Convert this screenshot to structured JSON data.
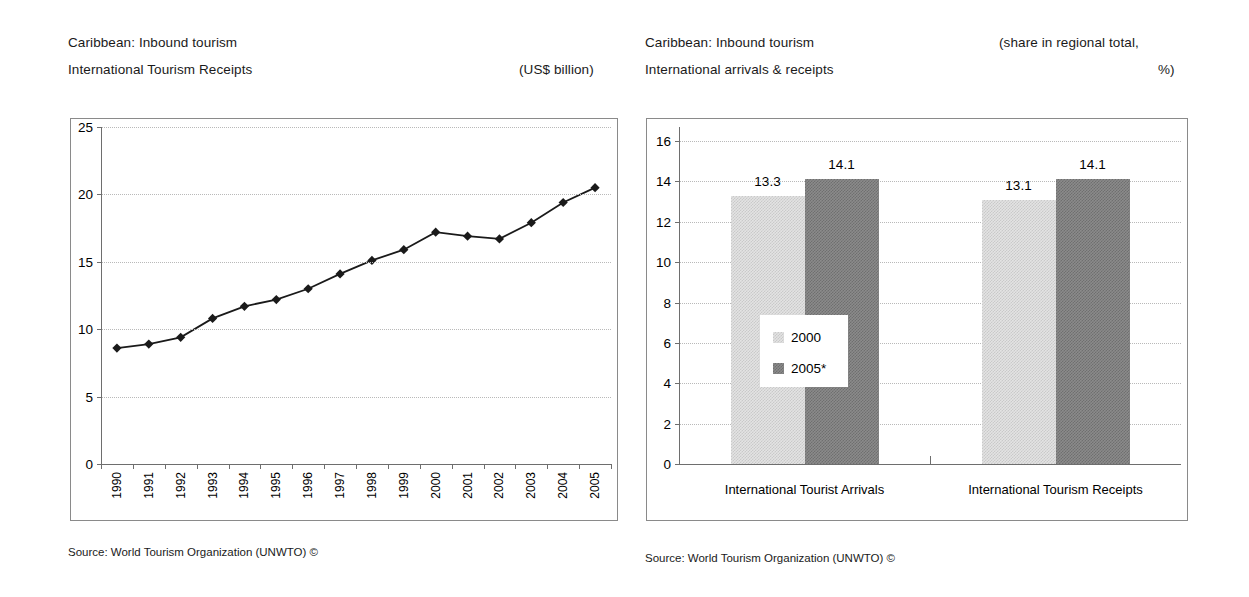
{
  "left_panel": {
    "header_line1": "Caribbean: Inbound tourism",
    "header_line2": "International Tourism Receipts",
    "unit_label": "(US$ billion)",
    "source": "Source: World Tourism Organization (UNWTO) ©"
  },
  "right_panel": {
    "header_line1": "Caribbean: Inbound tourism",
    "header_line2": "International arrivals & receipts",
    "unit_label_line1": "(share in regional total,",
    "unit_label_line2": "%)",
    "source": "Source: World Tourism Organization (UNWTO) ©"
  },
  "colors": {
    "series_2000": "#e3e3e3",
    "series_2005": "#8b8b8b",
    "axis": "#6e6e6e",
    "grid": "#b9b9b9",
    "border": "#8a8a8a"
  },
  "chart_data": [
    {
      "type": "line",
      "id": "caribbean-international-tourism-receipts",
      "title": "Caribbean: Inbound tourism — International Tourism Receipts",
      "xlabel": "",
      "ylabel": "",
      "unit": "US$ billion",
      "ylim": [
        0,
        25
      ],
      "yticks": [
        0,
        5,
        10,
        15,
        20,
        25
      ],
      "ytick_labels": [
        "0",
        "5",
        "10",
        "15",
        "20",
        "25"
      ],
      "grid": true,
      "legend": "none",
      "marker": "diamond",
      "categories": [
        "1990",
        "1991",
        "1992",
        "1993",
        "1994",
        "1995",
        "1996",
        "1997",
        "1998",
        "1999",
        "2000",
        "2001",
        "2002",
        "2003",
        "2004",
        "2005"
      ],
      "values": [
        8.6,
        8.9,
        9.4,
        10.8,
        11.7,
        12.2,
        13.0,
        14.1,
        15.1,
        15.9,
        17.2,
        16.9,
        16.7,
        17.9,
        19.4,
        20.5
      ]
    },
    {
      "type": "bar",
      "id": "caribbean-share-in-regional-total",
      "title": "Caribbean: Inbound tourism — International arrivals & receipts",
      "xlabel": "",
      "ylabel": "",
      "unit": "share in regional total, %",
      "ylim": [
        0,
        16
      ],
      "yticks": [
        0,
        2,
        4,
        6,
        8,
        10,
        12,
        14,
        16
      ],
      "ytick_labels": [
        "0",
        "2",
        "4",
        "6",
        "8",
        "10",
        "12",
        "14",
        "16"
      ],
      "grid": true,
      "legend": "inside-center",
      "categories": [
        "International Tourist Arrivals",
        "International Tourism Receipts"
      ],
      "series": [
        {
          "name": "2000",
          "values": [
            13.3,
            13.1
          ],
          "color": "#e3e3e3"
        },
        {
          "name": "2005*",
          "values": [
            14.1,
            14.1
          ],
          "color": "#8b8b8b"
        }
      ],
      "data_labels": [
        [
          "13.3",
          "14.1"
        ],
        [
          "13.1",
          "14.1"
        ]
      ]
    }
  ]
}
